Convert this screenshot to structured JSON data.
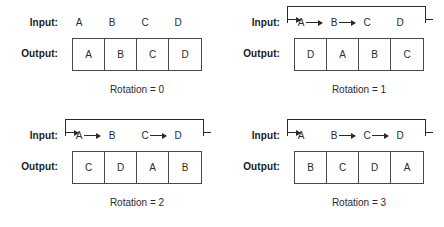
{
  "figure": {
    "colors": {
      "text": "#2b2b2b",
      "label": "#1a1a1a",
      "line": "#4a4a4a",
      "background": "#ffffff"
    },
    "label_input": "Input:",
    "label_output": "Output:"
  },
  "panels": [
    {
      "id": "rotation-0",
      "caption": "Rotation = 0",
      "input_letters": [
        "A",
        "B",
        "C",
        "D"
      ],
      "arrows": [],
      "wrap": false,
      "output_letters": [
        "A",
        "B",
        "C",
        "D"
      ]
    },
    {
      "id": "rotation-1",
      "caption": "Rotation = 1",
      "input_letters": [
        "A",
        "B",
        "C",
        "D"
      ],
      "arrows": [
        "A->B",
        "B->C"
      ],
      "wrap": true,
      "output_letters": [
        "D",
        "A",
        "B",
        "C"
      ]
    },
    {
      "id": "rotation-2",
      "caption": "Rotation = 2",
      "input_letters": [
        "A",
        "B",
        "C",
        "D"
      ],
      "arrows": [
        "A->B",
        "C->D"
      ],
      "wrap": true,
      "output_letters": [
        "C",
        "D",
        "A",
        "B"
      ]
    },
    {
      "id": "rotation-3",
      "caption": "Rotation = 3",
      "input_letters": [
        "A",
        "B",
        "C",
        "D"
      ],
      "arrows": [
        "B->C",
        "C->D"
      ],
      "wrap": true,
      "output_letters": [
        "B",
        "C",
        "D",
        "A"
      ]
    }
  ]
}
